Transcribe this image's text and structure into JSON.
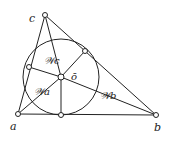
{
  "diagram": {
    "points": {
      "a": {
        "label": "a",
        "x": 18,
        "y": 114
      },
      "b": {
        "label": "b",
        "x": 156,
        "y": 115
      },
      "c": {
        "label": "c",
        "x": 45,
        "y": 15
      },
      "o": {
        "label": "ō",
        "x": 61,
        "y": 77
      }
    },
    "incircle_radius": 38,
    "tangent_points": [
      {
        "x": 61,
        "y": 115
      },
      {
        "x": 29,
        "y": 67
      },
      {
        "x": 85,
        "y": 51
      }
    ],
    "region_labels": {
      "wa": "𝒲a",
      "wb": "𝒲b",
      "wc": "𝒲c"
    },
    "colors": {
      "stroke": "#222222",
      "fill": "#ffffff"
    }
  }
}
